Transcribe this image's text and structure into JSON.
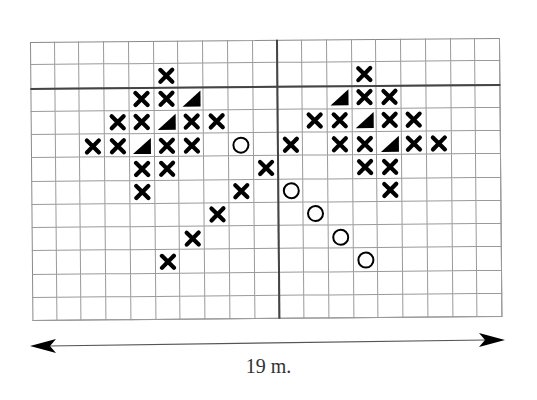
{
  "diagram": {
    "type": "planting-grid",
    "grid": {
      "columns": 19,
      "rows": 12,
      "thick_row_line_after": 2,
      "thick_col_line_after": 10
    },
    "legend_symbols": {
      "X": "cross-icon",
      "O": "circle-icon",
      "T": "triangle-icon"
    },
    "marks": [
      {
        "row": 1,
        "col": 5,
        "s": "X"
      },
      {
        "row": 2,
        "col": 4,
        "s": "X"
      },
      {
        "row": 2,
        "col": 5,
        "s": "X"
      },
      {
        "row": 2,
        "col": 6,
        "s": "T"
      },
      {
        "row": 3,
        "col": 3,
        "s": "X"
      },
      {
        "row": 3,
        "col": 4,
        "s": "X"
      },
      {
        "row": 3,
        "col": 5,
        "s": "T"
      },
      {
        "row": 3,
        "col": 6,
        "s": "X"
      },
      {
        "row": 3,
        "col": 7,
        "s": "X"
      },
      {
        "row": 4,
        "col": 2,
        "s": "X"
      },
      {
        "row": 4,
        "col": 3,
        "s": "X"
      },
      {
        "row": 4,
        "col": 4,
        "s": "T"
      },
      {
        "row": 4,
        "col": 5,
        "s": "X"
      },
      {
        "row": 4,
        "col": 6,
        "s": "X"
      },
      {
        "row": 4,
        "col": 8,
        "s": "O"
      },
      {
        "row": 5,
        "col": 4,
        "s": "X"
      },
      {
        "row": 5,
        "col": 5,
        "s": "X"
      },
      {
        "row": 6,
        "col": 4,
        "s": "X"
      },
      {
        "row": 5,
        "col": 9,
        "s": "X"
      },
      {
        "row": 6,
        "col": 8,
        "s": "X"
      },
      {
        "row": 7,
        "col": 7,
        "s": "X"
      },
      {
        "row": 8,
        "col": 6,
        "s": "X"
      },
      {
        "row": 9,
        "col": 5,
        "s": "X"
      },
      {
        "row": 4,
        "col": 10,
        "s": "X"
      },
      {
        "row": 6,
        "col": 10,
        "s": "O"
      },
      {
        "row": 7,
        "col": 11,
        "s": "O"
      },
      {
        "row": 8,
        "col": 12,
        "s": "O"
      },
      {
        "row": 9,
        "col": 13,
        "s": "O"
      },
      {
        "row": 1,
        "col": 13,
        "s": "X"
      },
      {
        "row": 2,
        "col": 12,
        "s": "T"
      },
      {
        "row": 2,
        "col": 13,
        "s": "X"
      },
      {
        "row": 2,
        "col": 14,
        "s": "X"
      },
      {
        "row": 3,
        "col": 11,
        "s": "X"
      },
      {
        "row": 3,
        "col": 12,
        "s": "X"
      },
      {
        "row": 3,
        "col": 13,
        "s": "T"
      },
      {
        "row": 3,
        "col": 14,
        "s": "X"
      },
      {
        "row": 3,
        "col": 15,
        "s": "X"
      },
      {
        "row": 4,
        "col": 12,
        "s": "X"
      },
      {
        "row": 4,
        "col": 13,
        "s": "X"
      },
      {
        "row": 4,
        "col": 14,
        "s": "T"
      },
      {
        "row": 4,
        "col": 15,
        "s": "X"
      },
      {
        "row": 4,
        "col": 16,
        "s": "X"
      },
      {
        "row": 5,
        "col": 13,
        "s": "X"
      },
      {
        "row": 5,
        "col": 14,
        "s": "X"
      },
      {
        "row": 6,
        "col": 14,
        "s": "X"
      }
    ],
    "dimension": {
      "label": "19 m.",
      "direction": "horizontal-double-arrow"
    }
  }
}
